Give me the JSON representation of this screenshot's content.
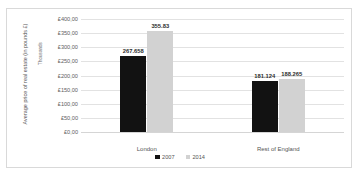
{
  "chart_data": {
    "type": "bar",
    "title": "",
    "subtitle": "",
    "xlabel": "",
    "ylabel": "Average price of real estate (in pounds £)",
    "yunits": "Thousands",
    "categories": [
      "London",
      "Rest of England"
    ],
    "series": [
      {
        "name": "2007",
        "color": "#121212",
        "values": [
          267.658,
          181.124
        ],
        "labels": [
          "267.658",
          "181.124"
        ]
      },
      {
        "name": "2014",
        "color": "#d2d2d2",
        "values": [
          355.83,
          188.265
        ],
        "labels": [
          "355.83",
          "188.265"
        ]
      }
    ],
    "ylim": [
      0,
      400
    ],
    "ytick_values": [
      400,
      350,
      300,
      250,
      200,
      150,
      100,
      50,
      0
    ],
    "ytick_labels": [
      "£400,00",
      "£350,00",
      "£300,00",
      "£250,00",
      "£200,00",
      "£150,00",
      "£100,00",
      "£50,00",
      "£0,00"
    ],
    "grid": true,
    "legend_position": "bottom",
    "legend": [
      "2007",
      "2014"
    ]
  }
}
